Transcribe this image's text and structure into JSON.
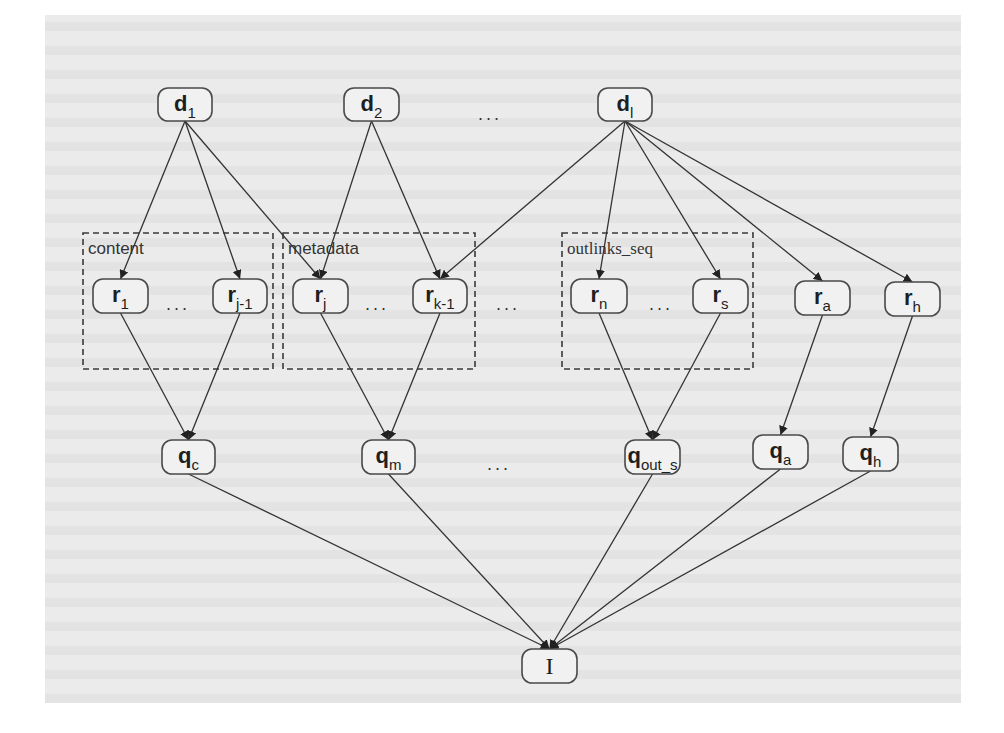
{
  "diagram": {
    "type": "directed-graph",
    "nodes": [
      {
        "id": "d1",
        "base": "d",
        "sub": "1",
        "x": 158,
        "y": 88,
        "w": 54,
        "h": 33
      },
      {
        "id": "d2",
        "base": "d",
        "sub": "2",
        "x": 344,
        "y": 88,
        "w": 55,
        "h": 33
      },
      {
        "id": "dl",
        "base": "d",
        "sub": "l",
        "x": 598,
        "y": 88,
        "w": 54,
        "h": 33
      },
      {
        "id": "r1",
        "base": "r",
        "sub": "1",
        "x": 93,
        "y": 279,
        "w": 55,
        "h": 34
      },
      {
        "id": "rj-1",
        "base": "r",
        "sub": "j-1",
        "x": 213,
        "y": 279,
        "w": 54,
        "h": 34
      },
      {
        "id": "rj",
        "base": "r",
        "sub": "j",
        "x": 293,
        "y": 279,
        "w": 55,
        "h": 34
      },
      {
        "id": "rk-1",
        "base": "r",
        "sub": "k-1",
        "x": 413,
        "y": 279,
        "w": 54,
        "h": 34
      },
      {
        "id": "rn",
        "base": "r",
        "sub": "n",
        "x": 571,
        "y": 279,
        "w": 56,
        "h": 34
      },
      {
        "id": "rs",
        "base": "r",
        "sub": "s",
        "x": 693,
        "y": 279,
        "w": 55,
        "h": 34
      },
      {
        "id": "ra",
        "base": "r",
        "sub": "a",
        "x": 795,
        "y": 281,
        "w": 55,
        "h": 34
      },
      {
        "id": "rh",
        "base": "r",
        "sub": "h",
        "x": 885,
        "y": 282,
        "w": 55,
        "h": 34
      },
      {
        "id": "qc",
        "base": "q",
        "sub": "c",
        "x": 162,
        "y": 440,
        "w": 53,
        "h": 34
      },
      {
        "id": "qm",
        "base": "q",
        "sub": "m",
        "x": 362,
        "y": 440,
        "w": 53,
        "h": 34
      },
      {
        "id": "qout_s",
        "base": "q",
        "sub": "out_s",
        "x": 625,
        "y": 440,
        "w": 55,
        "h": 34
      },
      {
        "id": "qa",
        "base": "q",
        "sub": "a",
        "x": 753,
        "y": 435,
        "w": 55,
        "h": 34
      },
      {
        "id": "qh",
        "base": "q",
        "sub": "h",
        "x": 843,
        "y": 437,
        "w": 55,
        "h": 34
      },
      {
        "id": "I",
        "base": "I",
        "sub": "",
        "x": 522,
        "y": 649,
        "w": 55,
        "h": 34,
        "serif": true
      }
    ],
    "edges": [
      [
        "d1",
        "r1"
      ],
      [
        "d1",
        "rj-1"
      ],
      [
        "d1",
        "rj"
      ],
      [
        "d2",
        "rj"
      ],
      [
        "d2",
        "rk-1"
      ],
      [
        "dl",
        "rk-1"
      ],
      [
        "dl",
        "rn"
      ],
      [
        "dl",
        "rs"
      ],
      [
        "dl",
        "ra"
      ],
      [
        "dl",
        "rh"
      ],
      [
        "r1",
        "qc"
      ],
      [
        "rj-1",
        "qc"
      ],
      [
        "rj",
        "qm"
      ],
      [
        "rk-1",
        "qm"
      ],
      [
        "rn",
        "qout_s"
      ],
      [
        "rs",
        "qout_s"
      ],
      [
        "ra",
        "qa"
      ],
      [
        "rh",
        "qh"
      ],
      [
        "qc",
        "I"
      ],
      [
        "qm",
        "I"
      ],
      [
        "qout_s",
        "I"
      ],
      [
        "qa",
        "I"
      ],
      [
        "qh",
        "I"
      ]
    ],
    "groups": [
      {
        "id": "content",
        "label": "content",
        "x": 83,
        "y": 233,
        "w": 190,
        "h": 136
      },
      {
        "id": "metadata",
        "label": "metadata",
        "x": 283,
        "y": 233,
        "w": 192,
        "h": 136
      },
      {
        "id": "outlinks_seq",
        "label": "outlinks_seq",
        "x": 562,
        "y": 233,
        "w": 191,
        "h": 136,
        "serif": true
      }
    ],
    "ellipses": [
      {
        "id": "dots-d-row",
        "text": "...",
        "x": 478,
        "y": 120
      },
      {
        "id": "dots-content",
        "text": "...",
        "x": 166,
        "y": 310
      },
      {
        "id": "dots-metadata",
        "text": "...",
        "x": 365,
        "y": 310
      },
      {
        "id": "dots-between-groups",
        "text": "...",
        "x": 496,
        "y": 310
      },
      {
        "id": "dots-outlinks",
        "text": "...",
        "x": 649,
        "y": 310
      },
      {
        "id": "dots-q-row",
        "text": "...",
        "x": 487,
        "y": 470
      }
    ]
  }
}
